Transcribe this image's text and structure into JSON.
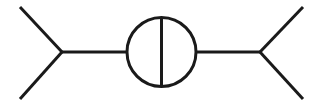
{
  "canvas": {
    "width": 323,
    "height": 106,
    "background_color": "#ffffff"
  },
  "style": {
    "stroke_color": "#1a1a1a",
    "stroke_width": 3,
    "circle_stroke_width": 3,
    "bond_stroke_width": 3
  },
  "diagram": {
    "type": "line-schematic",
    "elements": {
      "circle": {
        "name": "center-circle",
        "center_x": 161.5,
        "center_y": 52,
        "radius": 34.5
      },
      "vertical_divider": {
        "name": "circle-vertical-diameter",
        "x1": 161.5,
        "y1": 17.5,
        "x2": 161.5,
        "y2": 86.5
      },
      "left_connector": {
        "name": "left-horizontal-connector",
        "x1": 62,
        "y1": 52,
        "x2": 127,
        "y2": 52
      },
      "right_connector": {
        "name": "right-horizontal-connector",
        "x1": 196,
        "y1": 52,
        "x2": 260,
        "y2": 52
      },
      "left_fork_upper": {
        "name": "left-fork-upper-arm",
        "x1": 62,
        "y1": 52,
        "x2": 20,
        "y2": 7
      },
      "left_fork_lower": {
        "name": "left-fork-lower-arm",
        "x1": 62,
        "y1": 52,
        "x2": 20,
        "y2": 99
      },
      "right_fork_upper": {
        "name": "right-fork-upper-arm",
        "x1": 260,
        "y1": 52,
        "x2": 303,
        "y2": 7
      },
      "right_fork_lower": {
        "name": "right-fork-lower-arm",
        "x1": 260,
        "y1": 52,
        "x2": 303,
        "y2": 99
      }
    },
    "labels": {
      "title": "",
      "left_label": "",
      "right_label": "",
      "center_label": ""
    }
  }
}
